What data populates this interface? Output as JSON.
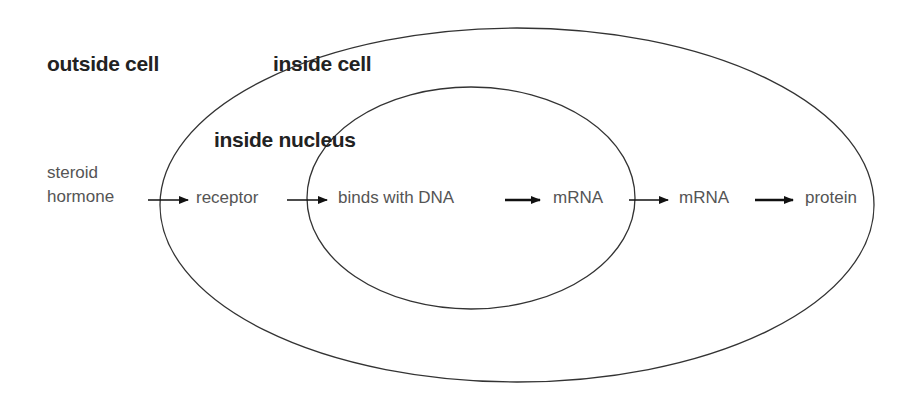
{
  "diagram": {
    "regions": {
      "outside": "outside cell",
      "cell": "inside cell",
      "nucleus": "inside nucleus"
    },
    "steps": {
      "hormone_line1": "steroid",
      "hormone_line2": "hormone",
      "receptor": "receptor",
      "binds": "binds with DNA",
      "mrna_nucleus": "mRNA",
      "mrna_cytoplasm": "mRNA",
      "protein": "protein"
    },
    "colors": {
      "stroke": "#333333",
      "arrow": "#111111",
      "background": "#ffffff"
    }
  }
}
